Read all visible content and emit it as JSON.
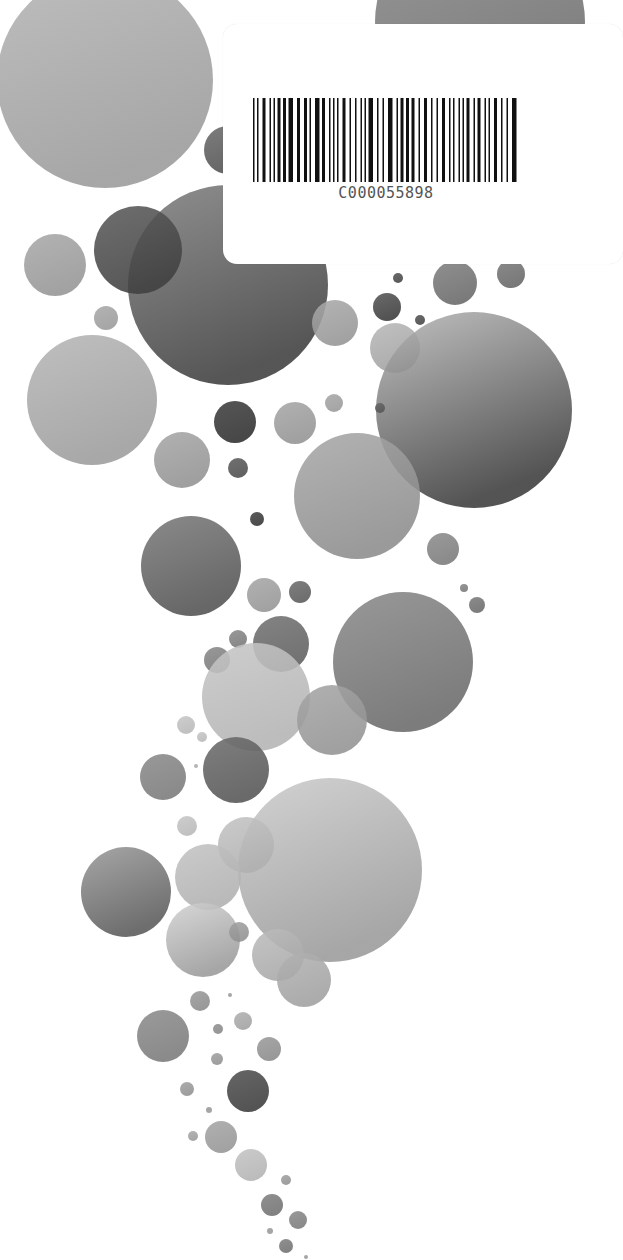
{
  "page": {
    "background": "#ffffff",
    "kind": "scanned cover with decorative bubbles"
  },
  "barcode": {
    "code": "C000055898",
    "bar_color": "#111111"
  },
  "circles": [
    {
      "cx": 105,
      "cy": 80,
      "r": 108,
      "light": "#b4b4b4",
      "dark": "#9a9a9a"
    },
    {
      "cx": 480,
      "cy": 22,
      "r": 105,
      "light": "#8a8a8a",
      "dark": "#6a6a6a"
    },
    {
      "cx": 228,
      "cy": 150,
      "r": 24,
      "light": "#6a6a6a",
      "dark": "#505050"
    },
    {
      "cx": 228,
      "cy": 285,
      "r": 100,
      "light": "#808080",
      "dark": "#3e3e3e"
    },
    {
      "cx": 138,
      "cy": 250,
      "r": 44,
      "light": "#5a5a5a",
      "dark": "#404040"
    },
    {
      "cx": 55,
      "cy": 265,
      "r": 31,
      "light": "#a8a8a8",
      "dark": "#959595"
    },
    {
      "cx": 106,
      "cy": 318,
      "r": 12,
      "light": "#a8a8a8",
      "dark": "#9a9a9a"
    },
    {
      "cx": 92,
      "cy": 400,
      "r": 65,
      "light": "#b6b6b6",
      "dark": "#9c9c9c"
    },
    {
      "cx": 335,
      "cy": 323,
      "r": 23,
      "light": "#a9a9a9",
      "dark": "#959595"
    },
    {
      "cx": 387,
      "cy": 307,
      "r": 14,
      "light": "#555555",
      "dark": "#3a3a3a"
    },
    {
      "cx": 398,
      "cy": 278,
      "r": 5,
      "light": "#555555",
      "dark": "#444444"
    },
    {
      "cx": 455,
      "cy": 283,
      "r": 22,
      "light": "#808080",
      "dark": "#686868"
    },
    {
      "cx": 511,
      "cy": 274,
      "r": 14,
      "light": "#7a7a7a",
      "dark": "#666666"
    },
    {
      "cx": 420,
      "cy": 320,
      "r": 5,
      "light": "#555555",
      "dark": "#444444"
    },
    {
      "cx": 395,
      "cy": 348,
      "r": 25,
      "light": "#b8b8b8",
      "dark": "#a0a0a0"
    },
    {
      "cx": 474,
      "cy": 410,
      "r": 98,
      "light": "#b8b8b8",
      "dark": "#3c3c3c"
    },
    {
      "cx": 380,
      "cy": 408,
      "r": 5,
      "light": "#666666",
      "dark": "#555555"
    },
    {
      "cx": 235,
      "cy": 422,
      "r": 21,
      "light": "#3e3e3e",
      "dark": "#2e2e2e"
    },
    {
      "cx": 295,
      "cy": 423,
      "r": 21,
      "light": "#a6a6a6",
      "dark": "#939393"
    },
    {
      "cx": 334,
      "cy": 403,
      "r": 9,
      "light": "#a6a6a6",
      "dark": "#999999"
    },
    {
      "cx": 182,
      "cy": 460,
      "r": 28,
      "light": "#a6a6a6",
      "dark": "#929292"
    },
    {
      "cx": 238,
      "cy": 468,
      "r": 10,
      "light": "#5c5c5c",
      "dark": "#4c4c4c"
    },
    {
      "cx": 357,
      "cy": 496,
      "r": 63,
      "light": "#a8a8a8",
      "dark": "#8c8c8c"
    },
    {
      "cx": 257,
      "cy": 519,
      "r": 7,
      "light": "#444444",
      "dark": "#333333"
    },
    {
      "cx": 191,
      "cy": 566,
      "r": 50,
      "light": "#7a7a7a",
      "dark": "#525252"
    },
    {
      "cx": 443,
      "cy": 549,
      "r": 16,
      "light": "#8c8c8c",
      "dark": "#7a7a7a"
    },
    {
      "cx": 264,
      "cy": 595,
      "r": 17,
      "light": "#a6a6a6",
      "dark": "#959595"
    },
    {
      "cx": 300,
      "cy": 592,
      "r": 11,
      "light": "#6c6c6c",
      "dark": "#5a5a5a"
    },
    {
      "cx": 464,
      "cy": 588,
      "r": 4,
      "light": "#888888",
      "dark": "#777777"
    },
    {
      "cx": 477,
      "cy": 605,
      "r": 8,
      "light": "#7a7a7a",
      "dark": "#6a6a6a"
    },
    {
      "cx": 403,
      "cy": 662,
      "r": 70,
      "light": "#8a8a8a",
      "dark": "#6a6a6a"
    },
    {
      "cx": 281,
      "cy": 644,
      "r": 28,
      "light": "#727272",
      "dark": "#5e5e5e"
    },
    {
      "cx": 238,
      "cy": 639,
      "r": 9,
      "light": "#8a8a8a",
      "dark": "#777777"
    },
    {
      "cx": 217,
      "cy": 660,
      "r": 13,
      "light": "#8a8a8a",
      "dark": "#777777"
    },
    {
      "cx": 256,
      "cy": 697,
      "r": 54,
      "light": "#c6c6c6",
      "dark": "#b3b3b3"
    },
    {
      "cx": 332,
      "cy": 720,
      "r": 35,
      "light": "#a5a5a5",
      "dark": "#939393"
    },
    {
      "cx": 186,
      "cy": 725,
      "r": 9,
      "light": "#c6c6c6",
      "dark": "#b8b8b8"
    },
    {
      "cx": 202,
      "cy": 737,
      "r": 5,
      "light": "#c6c6c6",
      "dark": "#b8b8b8"
    },
    {
      "cx": 236,
      "cy": 770,
      "r": 33,
      "light": "#6c6c6c",
      "dark": "#555555"
    },
    {
      "cx": 163,
      "cy": 777,
      "r": 23,
      "light": "#8a8a8a",
      "dark": "#7a7a7a"
    },
    {
      "cx": 196,
      "cy": 766,
      "r": 2,
      "light": "#aaaaaa",
      "dark": "#aaaaaa"
    },
    {
      "cx": 330,
      "cy": 870,
      "r": 92,
      "light": "#cccccc",
      "dark": "#9a9a9a"
    },
    {
      "cx": 187,
      "cy": 826,
      "r": 10,
      "light": "#c6c6c6",
      "dark": "#b8b8b8"
    },
    {
      "cx": 246,
      "cy": 845,
      "r": 28,
      "light": "#c3c3c3",
      "dark": "#b0b0b0"
    },
    {
      "cx": 126,
      "cy": 892,
      "r": 45,
      "light": "#9a9a9a",
      "dark": "#5a5a5a"
    },
    {
      "cx": 208,
      "cy": 877,
      "r": 33,
      "light": "#c3c3c3",
      "dark": "#b0b0b0"
    },
    {
      "cx": 203,
      "cy": 940,
      "r": 37,
      "light": "#d2d2d2",
      "dark": "#9a9a9a"
    },
    {
      "cx": 239,
      "cy": 932,
      "r": 10,
      "light": "#a0a0a0",
      "dark": "#909090"
    },
    {
      "cx": 278,
      "cy": 955,
      "r": 26,
      "light": "#bcbcbc",
      "dark": "#a8a8a8"
    },
    {
      "cx": 304,
      "cy": 980,
      "r": 27,
      "light": "#b2b2b2",
      "dark": "#a0a0a0"
    },
    {
      "cx": 200,
      "cy": 1001,
      "r": 10,
      "light": "#9a9a9a",
      "dark": "#8a8a8a"
    },
    {
      "cx": 230,
      "cy": 995,
      "r": 2,
      "light": "#999999",
      "dark": "#999999"
    },
    {
      "cx": 163,
      "cy": 1036,
      "r": 26,
      "light": "#8c8c8c",
      "dark": "#7a7a7a"
    },
    {
      "cx": 243,
      "cy": 1021,
      "r": 9,
      "light": "#b0b0b0",
      "dark": "#a0a0a0"
    },
    {
      "cx": 218,
      "cy": 1029,
      "r": 5,
      "light": "#909090",
      "dark": "#888888"
    },
    {
      "cx": 269,
      "cy": 1049,
      "r": 12,
      "light": "#9a9a9a",
      "dark": "#8a8a8a"
    },
    {
      "cx": 217,
      "cy": 1059,
      "r": 6,
      "light": "#a0a0a0",
      "dark": "#909090"
    },
    {
      "cx": 187,
      "cy": 1089,
      "r": 7,
      "light": "#a0a0a0",
      "dark": "#909090"
    },
    {
      "cx": 248,
      "cy": 1091,
      "r": 21,
      "light": "#505050",
      "dark": "#3c3c3c"
    },
    {
      "cx": 209,
      "cy": 1110,
      "r": 3,
      "light": "#999999",
      "dark": "#999999"
    },
    {
      "cx": 221,
      "cy": 1137,
      "r": 16,
      "light": "#a5a5a5",
      "dark": "#959595"
    },
    {
      "cx": 193,
      "cy": 1136,
      "r": 5,
      "light": "#aaaaaa",
      "dark": "#999999"
    },
    {
      "cx": 251,
      "cy": 1165,
      "r": 16,
      "light": "#c3c3c3",
      "dark": "#b3b3b3"
    },
    {
      "cx": 286,
      "cy": 1180,
      "r": 5,
      "light": "#a0a0a0",
      "dark": "#909090"
    },
    {
      "cx": 272,
      "cy": 1205,
      "r": 11,
      "light": "#808080",
      "dark": "#707070"
    },
    {
      "cx": 298,
      "cy": 1220,
      "r": 9,
      "light": "#8a8a8a",
      "dark": "#7a7a7a"
    },
    {
      "cx": 270,
      "cy": 1231,
      "r": 3,
      "light": "#999999",
      "dark": "#999999"
    },
    {
      "cx": 286,
      "cy": 1246,
      "r": 7,
      "light": "#808080",
      "dark": "#707070"
    },
    {
      "cx": 306,
      "cy": 1257,
      "r": 2,
      "light": "#999999",
      "dark": "#999999"
    }
  ]
}
